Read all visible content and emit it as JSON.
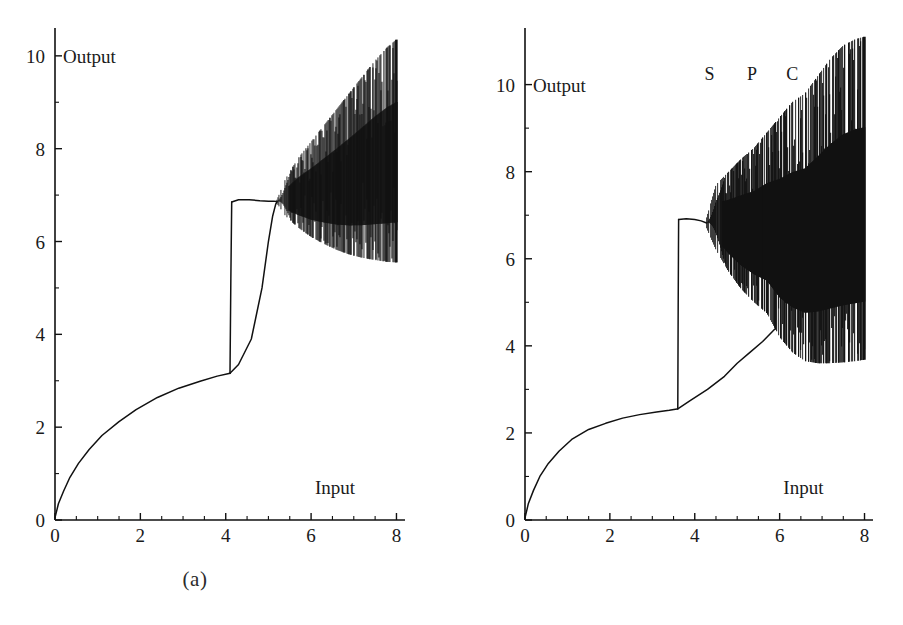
{
  "figure": {
    "panels": [
      {
        "id": "a",
        "caption": "(a)",
        "xlabel": "Input",
        "ylabel": "Output",
        "xticks": [
          "0",
          "2",
          "4",
          "6",
          "8"
        ],
        "yticks": [
          "0",
          "2",
          "4",
          "6",
          "8",
          "10"
        ],
        "annotations": []
      },
      {
        "id": "b",
        "caption": "(b)",
        "xlabel": "Input",
        "ylabel": "Output",
        "xticks": [
          "0",
          "2",
          "4",
          "6",
          "8"
        ],
        "yticks": [
          "0",
          "2",
          "4",
          "6",
          "8",
          "10"
        ],
        "annotations": [
          "S",
          "P",
          "C"
        ]
      }
    ]
  },
  "chart_data": [
    {
      "type": "line",
      "title": "(a)",
      "xlabel": "Input",
      "ylabel": "Output",
      "xlim": [
        0,
        8.2
      ],
      "ylim": [
        0,
        10.6
      ],
      "xticks": [
        0,
        2,
        4,
        6,
        8
      ],
      "yticks": [
        0,
        2,
        4,
        6,
        8,
        10
      ],
      "minor_xticks": [
        0.5,
        1,
        1.5,
        2.5,
        3,
        3.5,
        4.5,
        5,
        5.5,
        6.5,
        7,
        7.5
      ],
      "minor_yticks": [
        1,
        3,
        5,
        7,
        9
      ],
      "grid": false,
      "legend": "none",
      "description": "Bifurcation diagram of output versus input showing a hysteretic S-shaped response followed by a period-doubling cascade into a broad chaotic band.",
      "series": [
        {
          "name": "lower-stable-branch",
          "comment": "monotone rise from origin, concave, up to the fold point",
          "x": [
            0.0,
            0.08,
            0.2,
            0.35,
            0.55,
            0.8,
            1.1,
            1.5,
            1.9,
            2.4,
            2.9,
            3.4,
            3.8,
            4.05,
            4.1
          ],
          "y": [
            0.05,
            0.35,
            0.62,
            0.92,
            1.22,
            1.52,
            1.82,
            2.12,
            2.38,
            2.64,
            2.84,
            2.99,
            3.1,
            3.15,
            3.16
          ]
        },
        {
          "name": "upward-jump",
          "comment": "near-vertical jump at input 4.1 from output 3.16 to 6.85",
          "x": [
            4.1,
            4.12,
            4.14
          ],
          "y": [
            3.16,
            5.2,
            6.85
          ]
        },
        {
          "name": "upper-return-branch",
          "comment": "upper branch traced back rightwards from the jump top to the bifurcation point",
          "x": [
            4.14,
            4.3,
            4.55,
            4.8,
            5.0,
            5.12,
            5.2
          ],
          "y": [
            6.85,
            6.9,
            6.9,
            6.88,
            6.87,
            6.87,
            6.86
          ]
        },
        {
          "name": "hysteresis-middle-branch",
          "comment": "slow S-shaped rise from the lower branch up to the bifurcation point at input 5.2",
          "x": [
            4.1,
            4.3,
            4.6,
            4.85,
            5.0,
            5.1,
            5.17,
            5.2
          ],
          "y": [
            3.16,
            3.35,
            3.9,
            5.0,
            6.0,
            6.55,
            6.8,
            6.86
          ]
        }
      ],
      "bifurcation": {
        "onset_x": 5.2,
        "onset_y": 6.86,
        "comment": "period doubling begins; envelope widens to a chaotic band",
        "upper_envelope": {
          "x": [
            5.2,
            5.4,
            5.7,
            6.0,
            6.3,
            6.6,
            6.9,
            7.2,
            7.5,
            7.8,
            8.0
          ],
          "y": [
            6.9,
            7.35,
            7.8,
            8.15,
            8.5,
            8.85,
            9.2,
            9.55,
            9.9,
            10.2,
            10.35
          ]
        },
        "lower_envelope": {
          "x": [
            5.2,
            5.4,
            5.7,
            6.0,
            6.3,
            6.6,
            6.9,
            7.2,
            7.5,
            7.8,
            8.0
          ],
          "y": [
            6.82,
            6.55,
            6.3,
            6.1,
            5.95,
            5.82,
            5.72,
            5.65,
            5.6,
            5.56,
            5.55
          ]
        }
      }
    },
    {
      "type": "line",
      "title": "(b)",
      "xlabel": "Input",
      "ylabel": "Output",
      "xlim": [
        0,
        8.2
      ],
      "ylim": [
        0,
        11.3
      ],
      "xticks": [
        0,
        2,
        4,
        6,
        8
      ],
      "yticks": [
        0,
        2,
        4,
        6,
        8,
        10
      ],
      "minor_xticks": [
        0.5,
        1,
        1.5,
        2.5,
        3,
        3.5,
        4.5,
        5,
        5.5,
        6.5,
        7,
        7.5
      ],
      "minor_yticks": [
        1,
        3,
        5,
        7,
        9
      ],
      "grid": false,
      "legend": "none",
      "description": "Bifurcation diagram with an earlier jump at input 3.6, a period-doubling region labelled S, P and C, and a wide chaotic band reaching output 11.",
      "annotations": [
        {
          "label": "S",
          "x": 4.35,
          "y": 10.1
        },
        {
          "label": "P",
          "x": 5.35,
          "y": 10.1
        },
        {
          "label": "C",
          "x": 6.3,
          "y": 10.1
        }
      ],
      "series": [
        {
          "name": "lower-stable-branch",
          "comment": "monotone concave rise from origin to the fold at input 3.6",
          "x": [
            0.0,
            0.08,
            0.2,
            0.35,
            0.55,
            0.8,
            1.1,
            1.5,
            1.9,
            2.3,
            2.7,
            3.1,
            3.4,
            3.58
          ],
          "y": [
            0.05,
            0.38,
            0.68,
            1.0,
            1.3,
            1.58,
            1.85,
            2.08,
            2.22,
            2.34,
            2.42,
            2.48,
            2.52,
            2.55
          ]
        },
        {
          "name": "upward-jump",
          "comment": "near-vertical jump at input 3.6 from output 2.55 up to 6.9",
          "x": [
            3.6,
            3.61,
            3.62
          ],
          "y": [
            2.55,
            5.0,
            6.9
          ]
        },
        {
          "name": "upper-return-branch",
          "comment": "upper branch from the jump top across to the period-doubling onset",
          "x": [
            3.62,
            3.8,
            4.0,
            4.15,
            4.28
          ],
          "y": [
            6.9,
            6.92,
            6.9,
            6.87,
            6.82
          ]
        },
        {
          "name": "hysteresis-middle-branch",
          "comment": "slow rise from the fold point back up to the onset of bifurcation",
          "x": [
            3.6,
            3.9,
            4.3,
            4.7,
            5.0,
            5.3,
            5.6,
            5.9
          ],
          "y": [
            2.55,
            2.75,
            3.0,
            3.3,
            3.6,
            3.85,
            4.1,
            4.4
          ]
        }
      ],
      "bifurcation": {
        "onset_x": 4.28,
        "onset_y": 6.82,
        "comment": "period doubling (S) then periodic windows (P) then full chaos (C)",
        "upper_envelope": {
          "x": [
            4.28,
            4.5,
            4.8,
            5.1,
            5.4,
            5.7,
            6.0,
            6.3,
            6.6,
            6.9,
            7.2,
            7.5,
            7.8,
            8.0
          ],
          "y": [
            6.95,
            7.7,
            8.0,
            8.3,
            8.55,
            8.9,
            9.25,
            9.6,
            9.8,
            10.2,
            10.6,
            10.9,
            11.05,
            11.1
          ]
        },
        "lower_envelope": {
          "x": [
            4.28,
            4.5,
            4.8,
            5.1,
            5.4,
            5.7,
            6.0,
            6.3,
            6.6,
            6.9,
            7.2,
            7.5,
            7.8,
            8.0
          ],
          "y": [
            6.7,
            6.2,
            5.7,
            5.3,
            5.0,
            4.75,
            4.2,
            3.85,
            3.65,
            3.6,
            3.6,
            3.62,
            3.65,
            3.68
          ]
        }
      }
    }
  ]
}
